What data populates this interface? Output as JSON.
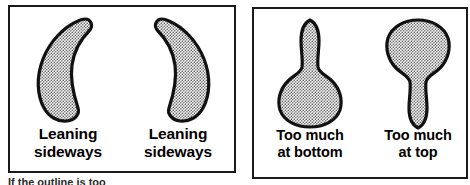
{
  "figure": {
    "background_color": "#ffffff",
    "outline_color": "#111111",
    "fill_color": "#5a5a5a",
    "panels": [
      {
        "id": "left",
        "items": [
          {
            "shape": "crescent-bulging-left",
            "caption_line_1": "Leaning",
            "caption_line_2": "sideways"
          },
          {
            "shape": "crescent-bulging-right",
            "caption_line_1": "Leaning",
            "caption_line_2": "sideways"
          }
        ]
      },
      {
        "id": "right",
        "items": [
          {
            "shape": "pear-bottom-heavy",
            "caption_line_1": "Too much",
            "caption_line_2": "at bottom"
          },
          {
            "shape": "pear-top-heavy",
            "caption_line_1": "Too much",
            "caption_line_2": "at top"
          }
        ]
      }
    ]
  },
  "bottom_cropped_text": "If the outline is too"
}
